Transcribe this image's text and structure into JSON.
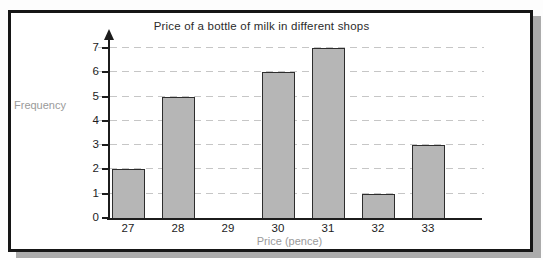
{
  "chart_data": {
    "type": "bar",
    "title": "Price of a bottle of milk in different shops",
    "xlabel": "Price (pence)",
    "ylabel": "Frequency",
    "categories": [
      "27",
      "28",
      "29",
      "30",
      "31",
      "32",
      "33"
    ],
    "values": [
      2,
      5,
      0,
      6,
      7,
      1,
      3
    ],
    "ylim": [
      0,
      7
    ],
    "yticks": [
      0,
      1,
      2,
      3,
      4,
      5,
      6,
      7
    ],
    "grid": "horizontal-dashed",
    "legend": "none",
    "colors": {
      "bar_fill": "#b6b6b6",
      "bar_border": "#2d2d2d",
      "gridline": "#c6c6c6",
      "axis": "#1c1c1c",
      "tick_label": "#1c1c1c",
      "gray_axis_label": "#9a9a9a",
      "title": "#2b2b2b",
      "frame_border": "#161616",
      "frame_shadow": "#ababab",
      "background": "#ffffff"
    }
  }
}
